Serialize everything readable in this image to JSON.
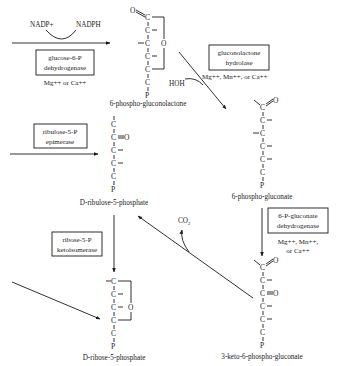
{
  "diagram": {
    "type": "biochemical-pathway",
    "compounds": {
      "c1": {
        "name": "6-phospho-gluconolactone"
      },
      "c2": {
        "name": "6-phospho-gluconate"
      },
      "c3": {
        "name": "3-keto-6-phospho-gluconate"
      },
      "c4": {
        "name": "D-ribulose-5-phosphate"
      },
      "c5": {
        "name": "D-ribose-5-phosphate"
      }
    },
    "enzymes": {
      "e1": {
        "line1": "glucose-6-P",
        "line2": "dehydrogenase",
        "cofactors": "Mg++ or Ca++"
      },
      "e2": {
        "line1": "gluconolactone",
        "line2": "hydrolase",
        "cofactors": "Mg++, Mn++, or Ca++"
      },
      "e3": {
        "line1": "6-P-gluconate",
        "line2": "dehydrogenase",
        "cofactors1": "Mg++, Mn++,",
        "cofactors2": "or Ca++"
      },
      "e4": {
        "line1": "ribulose-5-P",
        "line2": "epimerase"
      },
      "e5": {
        "line1": "ribose-5-P",
        "line2": "ketoisomerase"
      }
    },
    "cosubstrates": {
      "nadp": "NADP+",
      "nadph": "NADPH",
      "hoh": "HOH",
      "co2": "CO2"
    },
    "atoms": {
      "C": "C",
      "O": "O",
      "P": "P"
    }
  }
}
